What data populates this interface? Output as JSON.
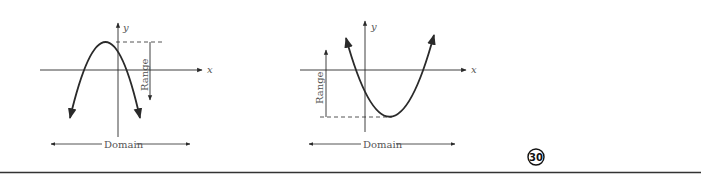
{
  "diagrams": [
    {
      "id": "downward-parabola",
      "axis_labels": {
        "x": "x",
        "y": "y"
      },
      "range_label": "Range",
      "domain_label": "Domain"
    },
    {
      "id": "upward-parabola",
      "axis_labels": {
        "x": "x",
        "y": "y"
      },
      "range_label": "Range",
      "domain_label": "Domain"
    }
  ],
  "badge": {
    "number": "30"
  },
  "colors": {
    "ink": "#2a2a2a",
    "label": "#555555",
    "rule": "#333333"
  }
}
